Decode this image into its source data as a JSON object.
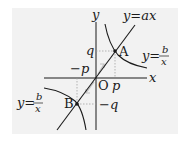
{
  "diagram": {
    "background": "#f2f2f2",
    "axes": {
      "x_label": "x",
      "y_label": "y",
      "origin_label": "O"
    },
    "line": {
      "label": "y=ax"
    },
    "hyperbola": {
      "label_prefix": "y=",
      "numerator": "b",
      "denominator": "x"
    },
    "points": [
      {
        "name": "A",
        "coords": "(p, q)"
      },
      {
        "name": "B",
        "coords": "(-p, -q)"
      }
    ],
    "tick_labels": {
      "q": "q",
      "neg_p": "−p",
      "p": "p",
      "neg_q": "−q"
    },
    "colors": {
      "curve": "#1a1a1a",
      "guide": "#999999",
      "arrow": "#bbbbbb"
    }
  }
}
